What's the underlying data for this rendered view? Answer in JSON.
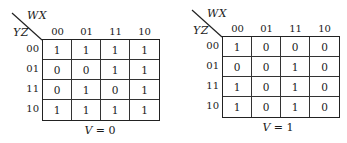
{
  "maps": [
    {
      "col_var": "WX",
      "row_var": "YZ",
      "col_labels": [
        "00",
        "01",
        "11",
        "10"
      ],
      "row_labels": [
        "00",
        "01",
        "11",
        "10"
      ],
      "cells": [
        [
          "1",
          "1",
          "1",
          "1"
        ],
        [
          "0",
          "0",
          "1",
          "1"
        ],
        [
          "0",
          "1",
          "0",
          "1"
        ],
        [
          "1",
          "1",
          "1",
          "1"
        ]
      ],
      "caption_var": "V",
      "caption_eq": " = 0"
    },
    {
      "col_var": "WX",
      "row_var": "YZ",
      "col_labels": [
        "00",
        "01",
        "11",
        "10"
      ],
      "row_labels": [
        "00",
        "01",
        "11",
        "10"
      ],
      "cells": [
        [
          "1",
          "0",
          "0",
          "0"
        ],
        [
          "0",
          "0",
          "1",
          "0"
        ],
        [
          "1",
          "0",
          "1",
          "0"
        ],
        [
          "1",
          "0",
          "1",
          "0"
        ]
      ],
      "caption_var": "V",
      "caption_eq": " = 1"
    }
  ]
}
